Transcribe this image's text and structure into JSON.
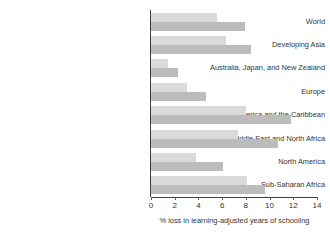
{
  "chart_data": {
    "type": "bar",
    "orientation": "horizontal",
    "title": "",
    "xlabel": "% loss in learning-adjusted years of schooling",
    "ylabel": "",
    "xlim": [
      0,
      14
    ],
    "xticks": [
      0,
      2,
      4,
      6,
      8,
      10,
      12,
      14
    ],
    "xtick_labels": [
      "0",
      "2",
      "4",
      "6",
      "8",
      "10",
      "12",
      "14"
    ],
    "grid": false,
    "legend": "none",
    "categories": [
      "World",
      "Developing Asia",
      "Australia, Japan, and New Zealand",
      "Europe",
      "Latin America and the Caribbean",
      "Middle East and North Africa",
      "North America",
      "Sub-Saharan Africa"
    ],
    "series": [
      {
        "name": "light-series",
        "color": "#dadada",
        "values": [
          5.6,
          6.3,
          1.4,
          3.0,
          8.0,
          7.3,
          3.8,
          8.1
        ]
      },
      {
        "name": "dark-series",
        "color": "#bcbcbc",
        "values": [
          7.9,
          8.4,
          2.3,
          4.6,
          11.8,
          10.7,
          6.1,
          9.6
        ]
      }
    ]
  },
  "colors": {
    "axis": "#3f3f3f",
    "text": "#333333",
    "background": "#ffffff"
  }
}
